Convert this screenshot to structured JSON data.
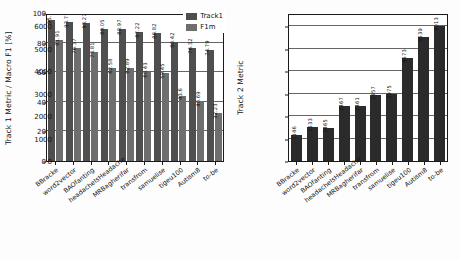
{
  "colors": {
    "series_track1": "#4f4f4f",
    "series_f1m": "#6e6e6e",
    "series_track2": "#2b2b2b",
    "axis": "#1a1a1a",
    "grid": "#4a4a4a",
    "background": "#ffffff",
    "text": "#111111"
  },
  "chart_data": [
    {
      "type": "bar",
      "id": "track1-chart",
      "title": "",
      "xlabel": "",
      "ylabel": "Track 1 Metric / Macro F1 [%]",
      "ylim": [
        0,
        100
      ],
      "yticks": [
        0,
        20,
        40,
        60,
        80,
        100
      ],
      "ytick_labels": [
        "0",
        "20",
        "40",
        "60",
        "80",
        "100"
      ],
      "grid": true,
      "legend_position": "upper right",
      "categories": [
        "BBracke",
        "word2vector",
        "BAOfanting",
        "headacheIsHeadache",
        "MRBagherifar",
        "transfrom",
        "samuelise",
        "tigeu100",
        "Autism8",
        "to-be"
      ],
      "series": [
        {
          "name": "Track1",
          "color": "#4f4f4f",
          "values": [
            95.1,
            93.71,
            93.27,
            89.05,
            88.97,
            87.22,
            86.82,
            80.42,
            76.32,
            74.79
          ],
          "labels": [
            "95.1",
            "93.71",
            "93.27",
            "89.05",
            "88.97",
            "87.22",
            "86.82",
            "80.42",
            "76.32",
            "74.79"
          ]
        },
        {
          "name": "F1m",
          "color": "#6e6e6e",
          "values": [
            81.91,
            76.37,
            73.81,
            62.58,
            62.89,
            60.43,
            59.45,
            43.6,
            40.69,
            32.23
          ],
          "labels": [
            "81.91",
            "76.37",
            "73.81",
            "62.58",
            "62.89",
            "60.43",
            "59.45",
            "43.6",
            "40.69",
            "32.23"
          ]
        }
      ]
    },
    {
      "type": "bar",
      "id": "track2-chart",
      "title": "",
      "xlabel": "",
      "ylabel": "Track 2 Metric",
      "ylim": [
        0,
        6600
      ],
      "yticks": [
        0,
        1000,
        2000,
        3000,
        4000,
        5000,
        6000
      ],
      "ytick_labels": [
        "0",
        "1000",
        "2000",
        "3000",
        "4000",
        "5000",
        "6000"
      ],
      "grid": true,
      "legend_position": "none",
      "categories": [
        "BBracke",
        "word2vector",
        "BAOfanting",
        "headacheIsHeadache",
        "MRBagherifar",
        "transfrom",
        "samuelise",
        "tigeu100",
        "Autism8",
        "to-be"
      ],
      "series": [
        {
          "name": "Track2",
          "color": "#2b2b2b",
          "values": [
            1146,
            1533,
            1465,
            2467,
            2461,
            2957,
            2975,
            4573,
            5539,
            6013
          ],
          "labels": [
            "1146",
            "1533",
            "1465",
            "2467",
            "2461",
            "2957",
            "2975",
            "4573",
            "5539",
            "6013"
          ]
        }
      ]
    }
  ],
  "legend": {
    "items": [
      {
        "label": "Track1",
        "color": "#4f4f4f"
      },
      {
        "label": "F1m",
        "color": "#6e6e6e"
      }
    ]
  }
}
